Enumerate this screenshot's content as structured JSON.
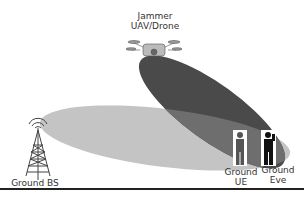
{
  "diagram": {
    "jammer": {
      "label_line1": "Jammer",
      "label_line2": "UAV/Drone",
      "icon": "drone-icon"
    },
    "base_station": {
      "label": "Ground BS",
      "icon": "cell-tower-icon"
    },
    "ue": {
      "label_line1": "Ground",
      "label_line2": "UE",
      "icon": "person-icon"
    },
    "eve": {
      "label_line1": "Ground",
      "label_line2": "Eve",
      "icon": "person-icon"
    },
    "colors": {
      "bs_beam": "#c4c4c4",
      "jammer_beam": "#4a4a4a",
      "overlap": "#6b6b6b",
      "ue_figure": "#555555",
      "eve_figure": "#111111",
      "bottom_rule": "#222222"
    }
  }
}
